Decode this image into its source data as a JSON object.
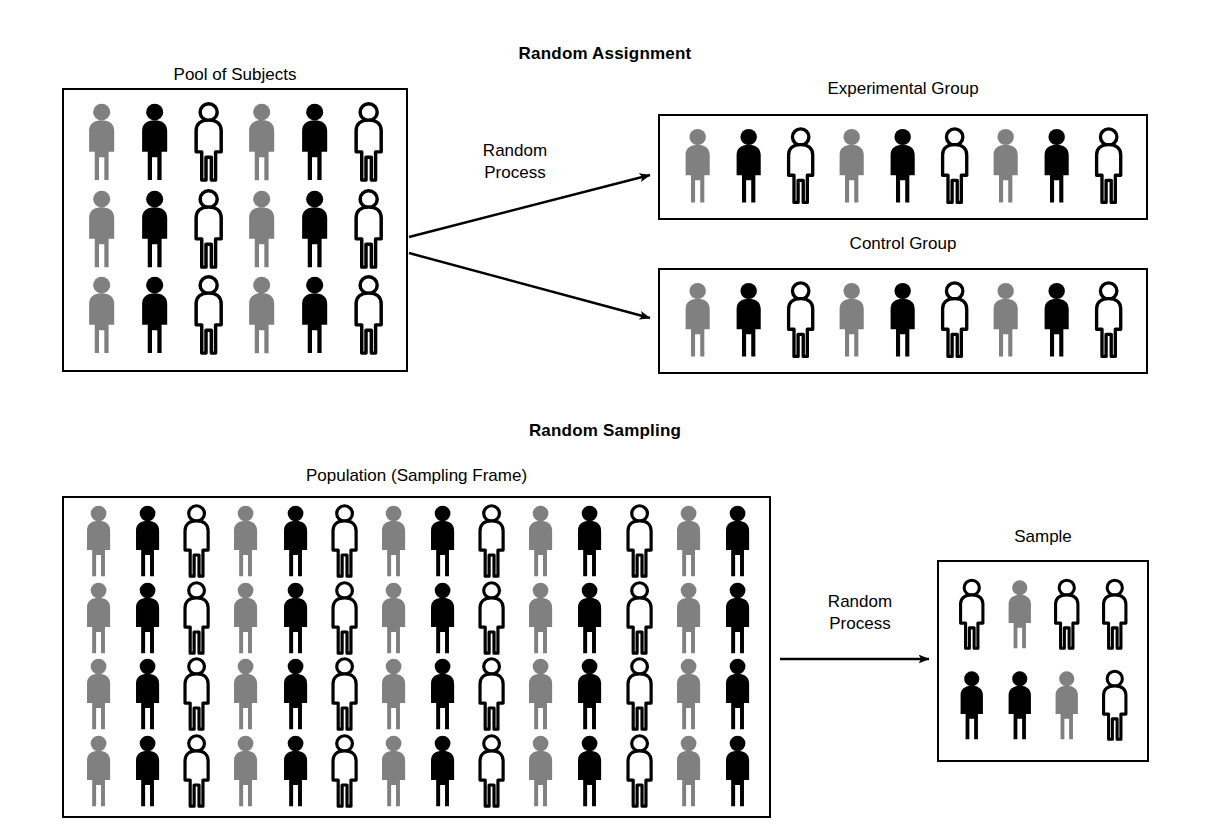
{
  "figure": {
    "colors": {
      "gray": "#808080",
      "black": "#000000",
      "white": "#ffffff",
      "outline": "#000000",
      "background": "#ffffff"
    }
  },
  "sections": {
    "assignment": {
      "heading": "Random Assignment",
      "process_label_line1": "Random",
      "process_label_line2": "Process",
      "pool": {
        "label": "Pool of Subjects",
        "rows": 3,
        "cols": 6,
        "figures": [
          [
            "gray",
            "black",
            "white",
            "gray",
            "black",
            "white"
          ],
          [
            "gray",
            "black",
            "white",
            "gray",
            "black",
            "white"
          ],
          [
            "gray",
            "black",
            "white",
            "gray",
            "black",
            "white"
          ]
        ]
      },
      "experimental": {
        "label": "Experimental Group",
        "rows": 1,
        "cols": 9,
        "figures": [
          [
            "gray",
            "black",
            "white",
            "gray",
            "black",
            "white",
            "gray",
            "black",
            "white"
          ]
        ]
      },
      "control": {
        "label": "Control Group",
        "rows": 1,
        "cols": 9,
        "figures": [
          [
            "gray",
            "black",
            "white",
            "gray",
            "black",
            "white",
            "gray",
            "black",
            "white"
          ]
        ]
      }
    },
    "sampling": {
      "heading": "Random Sampling",
      "process_label_line1": "Random",
      "process_label_line2": "Process",
      "population": {
        "label": "Population (Sampling Frame)",
        "rows": 4,
        "cols": 14,
        "figures": [
          [
            "gray",
            "black",
            "white",
            "gray",
            "black",
            "white",
            "gray",
            "black",
            "white",
            "gray",
            "black",
            "white",
            "gray",
            "black"
          ],
          [
            "gray",
            "black",
            "white",
            "gray",
            "black",
            "white",
            "gray",
            "black",
            "white",
            "gray",
            "black",
            "white",
            "gray",
            "black"
          ],
          [
            "gray",
            "black",
            "white",
            "gray",
            "black",
            "white",
            "gray",
            "black",
            "white",
            "gray",
            "black",
            "white",
            "gray",
            "black"
          ],
          [
            "gray",
            "black",
            "white",
            "gray",
            "black",
            "white",
            "gray",
            "black",
            "white",
            "gray",
            "black",
            "white",
            "gray",
            "black"
          ]
        ]
      },
      "sample": {
        "label": "Sample",
        "rows": 2,
        "cols": 4,
        "figures": [
          [
            "white",
            "gray",
            "white",
            "white"
          ],
          [
            "black",
            "black",
            "gray",
            "white"
          ]
        ]
      }
    }
  },
  "chart_data": {
    "type": "diagram",
    "panels": [
      {
        "name": "Random Assignment",
        "source": {
          "label": "Pool of Subjects",
          "count": 18,
          "gray": 6,
          "black": 6,
          "white": 6
        },
        "process": "Random Process",
        "targets": [
          {
            "label": "Experimental Group",
            "count": 9,
            "gray": 3,
            "black": 3,
            "white": 3
          },
          {
            "label": "Control Group",
            "count": 9,
            "gray": 3,
            "black": 3,
            "white": 3
          }
        ]
      },
      {
        "name": "Random Sampling",
        "source": {
          "label": "Population (Sampling Frame)",
          "count": 56,
          "gray": 20,
          "black": 20,
          "white": 16
        },
        "process": "Random Process",
        "targets": [
          {
            "label": "Sample",
            "count": 8,
            "gray": 2,
            "black": 2,
            "white": 4
          }
        ]
      }
    ]
  }
}
